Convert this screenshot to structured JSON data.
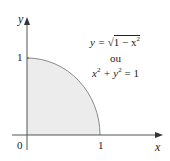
{
  "figure": {
    "axes": {
      "x_label": "x",
      "y_label": "y",
      "origin_label": "0",
      "x_tick_label": "1",
      "y_tick_label": "1"
    },
    "equations": {
      "line1_lhs": "y = ",
      "line1_rad": "1 − x",
      "line1_exp": "2",
      "connector": "ou",
      "line2_a": "x",
      "line2_a_exp": "2",
      "line2_plus": " + y",
      "line2_b_exp": "2",
      "line2_rhs": " = 1"
    },
    "colors": {
      "fill": "#ececec",
      "curve": "#888888",
      "axes": "#555555"
    }
  }
}
